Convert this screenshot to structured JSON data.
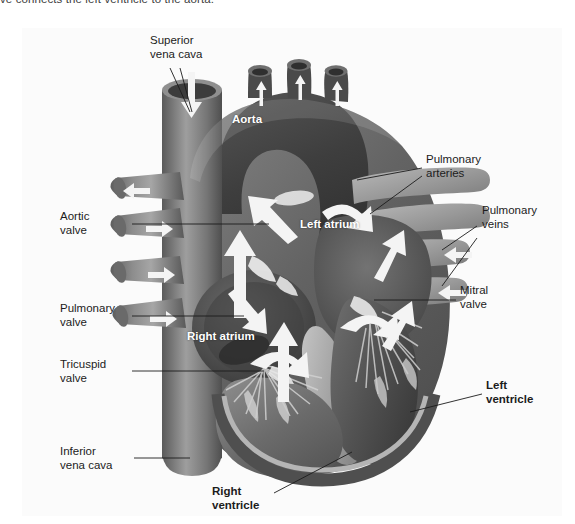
{
  "caption": "ve connects the left ventricle to the aorta.",
  "figure": {
    "background_color": "#fbfbfb",
    "labels": {
      "superior_vena_cava": "Superior\nvena cava",
      "aorta": "Aorta",
      "pulmonary_arteries": "Pulmonary\narteries",
      "pulmonary_veins": "Pulmonary\nveins",
      "aortic_valve": "Aortic\nvalve",
      "left_atrium": "Left atrium",
      "mitral_valve": "Mitral\nvalve",
      "pulmonary_valve": "Pulmonary\nvalve",
      "right_atrium": "Right atrium",
      "tricuspid_valve": "Tricuspid\nvalve",
      "left_ventricle": "Left\nventricle",
      "inferior_vena_cava": "Inferior\nvena cava",
      "right_ventricle": "Right\nventricle"
    },
    "colors": {
      "muscle_dark": "#4a4a4a",
      "muscle_mid": "#6e6e6e",
      "muscle_light": "#9a9a9a",
      "chamber_dark": "#3a3a3a",
      "vessel_gray": "#7d7d7d",
      "highlight": "#d8d8d8",
      "arrow_white": "#f2f2f2",
      "label_text": "#1c1c1c",
      "panel_bg": "#fbfbfb"
    }
  }
}
